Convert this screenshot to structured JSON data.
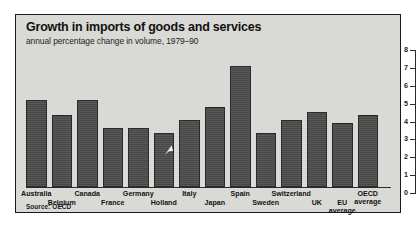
{
  "header": {
    "title": "Growth in imports of goods and services",
    "subtitle": "annual percentage change in volume, 1979–90"
  },
  "source": "Source: OECD",
  "colors": {
    "panel_background": "#d9d9d6",
    "bar_fill": "#4b4b4b",
    "axis": "#2b2b2b",
    "text": "#121212",
    "page_background": "#ffffff"
  },
  "axis": {
    "position": "right",
    "ticks": [
      "8",
      "7",
      "6",
      "5",
      "4",
      "3",
      "2",
      "1",
      "0"
    ]
  },
  "chart_data": {
    "type": "bar",
    "title": "Growth in imports of goods and services",
    "subtitle": "annual percentage change in volume, 1979–90",
    "xlabel": "",
    "ylabel": "",
    "ylim": [
      0,
      8
    ],
    "grid": false,
    "legend": null,
    "axis_position": "right",
    "source": "Source: OECD",
    "categories": [
      "Australia",
      "Belgium",
      "Canada",
      "France",
      "Germany",
      "Holland",
      "Italy",
      "Japan",
      "Spain",
      "Sweden",
      "Switzerland",
      "UK",
      "EU average",
      "OECD average"
    ],
    "values": [
      5.2,
      4.3,
      5.2,
      3.5,
      3.5,
      3.2,
      4.0,
      4.8,
      7.2,
      3.2,
      4.0,
      4.5,
      3.8,
      4.3
    ],
    "label_rows": [
      0,
      1,
      0,
      1,
      0,
      1,
      0,
      1,
      0,
      1,
      0,
      1,
      1,
      0
    ],
    "label_lines": [
      [
        "Australia"
      ],
      [
        "Belgium"
      ],
      [
        "Canada"
      ],
      [
        "France"
      ],
      [
        "Germany"
      ],
      [
        "Holland"
      ],
      [
        "Italy"
      ],
      [
        "Japan"
      ],
      [
        "Spain"
      ],
      [
        "Sweden"
      ],
      [
        "Switzerland"
      ],
      [
        "UK"
      ],
      [
        "EU",
        "average"
      ],
      [
        "OECD",
        "average"
      ]
    ]
  }
}
